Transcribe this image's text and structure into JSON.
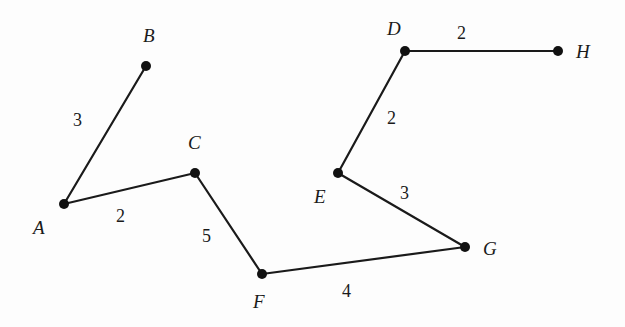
{
  "diagram": {
    "type": "weighted-undirected-graph",
    "nodes": [
      {
        "id": "A",
        "label": "A",
        "x": 64,
        "y": 204,
        "lx": 33,
        "ly": 234
      },
      {
        "id": "B",
        "label": "B",
        "x": 146,
        "y": 66,
        "lx": 143,
        "ly": 42
      },
      {
        "id": "C",
        "label": "C",
        "x": 195,
        "y": 173,
        "lx": 188,
        "ly": 149
      },
      {
        "id": "D",
        "label": "D",
        "x": 405,
        "y": 51,
        "lx": 387,
        "ly": 35
      },
      {
        "id": "E",
        "label": "E",
        "x": 338,
        "y": 173,
        "lx": 314,
        "ly": 203
      },
      {
        "id": "F",
        "label": "F",
        "x": 262,
        "y": 274,
        "lx": 253,
        "ly": 308
      },
      {
        "id": "G",
        "label": "G",
        "x": 465,
        "y": 247,
        "lx": 483,
        "ly": 255
      },
      {
        "id": "H",
        "label": "H",
        "x": 558,
        "y": 51,
        "lx": 576,
        "ly": 58
      }
    ],
    "edges": [
      {
        "from": "A",
        "to": "B",
        "weight": "3",
        "wx": 73,
        "wy": 126
      },
      {
        "from": "A",
        "to": "C",
        "weight": "2",
        "wx": 116,
        "wy": 222
      },
      {
        "from": "C",
        "to": "F",
        "weight": "5",
        "wx": 202,
        "wy": 242
      },
      {
        "from": "F",
        "to": "G",
        "weight": "4",
        "wx": 342,
        "wy": 297
      },
      {
        "from": "E",
        "to": "G",
        "weight": "3",
        "wx": 400,
        "wy": 199
      },
      {
        "from": "D",
        "to": "E",
        "weight": "2",
        "wx": 387,
        "wy": 124
      },
      {
        "from": "D",
        "to": "H",
        "weight": "2",
        "wx": 457,
        "wy": 39
      }
    ]
  }
}
